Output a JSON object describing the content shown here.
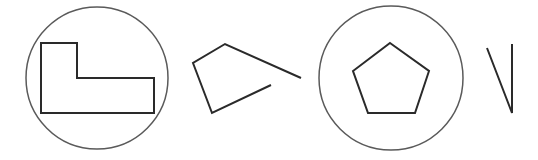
{
  "diagram": {
    "background": "#ffffff",
    "stroke_color": "#2a2a2a",
    "circle_color": "#5a5a5a",
    "figures": [
      {
        "name": "circled-l-shape",
        "circle": {
          "cx": 97,
          "cy": 78,
          "r": 71
        },
        "shape": "polygon",
        "points": "41,43 77,43 77,78 154,78 154,113 41,113"
      },
      {
        "name": "open-quadrilateral",
        "shape": "polyline",
        "points": "301,78 225,44 193,63 212,113 271,85"
      },
      {
        "name": "circled-pentagon",
        "circle": {
          "cx": 391,
          "cy": 78,
          "r": 72
        },
        "shape": "polygon",
        "points": "390,43 429,71 415,113 368,113 353,71"
      },
      {
        "name": "v-stroke",
        "shape": "polyline",
        "points": "487,48 512,113 512,44"
      }
    ]
  }
}
